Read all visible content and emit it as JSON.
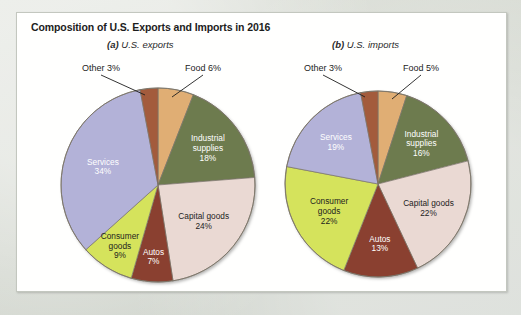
{
  "figure": {
    "title": "Composition of U.S. Exports and Imports in 2016",
    "panel_a_prefix": "(a)",
    "panel_a_caption": "U.S. exports",
    "panel_b_prefix": "(b)",
    "panel_b_caption": "U.S. imports"
  },
  "colors": {
    "food": "#e0ae74",
    "industrial_supplies": "#6d7b4e",
    "capital_goods": "#ead9d3",
    "autos": "#8a4030",
    "consumer_goods": "#d5e35c",
    "services": "#b3b2d8",
    "other": "#a35b3c",
    "slice_stroke": "#7a7468",
    "background": "#d8dcd5",
    "card": "#ffffff"
  },
  "chart_data": [
    {
      "type": "pie",
      "title": "(a) U.S. exports",
      "categories": [
        "Food",
        "Industrial supplies",
        "Capital goods",
        "Autos",
        "Consumer goods",
        "Services",
        "Other"
      ],
      "values": [
        6,
        18,
        24,
        7,
        9,
        34,
        3
      ],
      "labels": [
        "Food 6%",
        "Industrial supplies 18%",
        "Capital goods 24%",
        "Autos 7%",
        "Consumer goods 9%",
        "Services 34%",
        "Other 3%"
      ],
      "unit": "percent",
      "start_angle_deg": 0,
      "direction": "clockwise",
      "legend": "none",
      "slices": [
        {
          "name": "Food",
          "value": 6,
          "label_lines": [
            "Food 6%"
          ],
          "label_style": "callout",
          "text_color": "dark",
          "color": "#e0ae74"
        },
        {
          "name": "Industrial supplies",
          "value": 18,
          "label_lines": [
            "Industrial",
            "supplies",
            "18%"
          ],
          "label_style": "inside",
          "text_color": "light",
          "color": "#6d7b4e"
        },
        {
          "name": "Capital goods",
          "value": 24,
          "label_lines": [
            "Capital goods",
            "24%"
          ],
          "label_style": "inside",
          "text_color": "dark",
          "color": "#ead9d3"
        },
        {
          "name": "Autos",
          "value": 7,
          "label_lines": [
            "Autos",
            "7%"
          ],
          "label_style": "inside",
          "text_color": "light",
          "color": "#8a4030"
        },
        {
          "name": "Consumer goods",
          "value": 9,
          "label_lines": [
            "Consumer",
            "goods",
            "9%"
          ],
          "label_style": "inside",
          "text_color": "dark",
          "color": "#d5e35c"
        },
        {
          "name": "Services",
          "value": 34,
          "label_lines": [
            "Services",
            "34%"
          ],
          "label_style": "inside",
          "text_color": "light",
          "color": "#b3b2d8"
        },
        {
          "name": "Other",
          "value": 3,
          "label_lines": [
            "Other 3%"
          ],
          "label_style": "callout",
          "text_color": "dark",
          "color": "#a35b3c"
        }
      ]
    },
    {
      "type": "pie",
      "title": "(b) U.S. imports",
      "categories": [
        "Food",
        "Industrial supplies",
        "Capital goods",
        "Autos",
        "Consumer goods",
        "Services",
        "Other"
      ],
      "values": [
        5,
        16,
        22,
        13,
        22,
        19,
        3
      ],
      "labels": [
        "Food 5%",
        "Industrial supplies 16%",
        "Capital goods 22%",
        "Autos 13%",
        "Consumer goods 22%",
        "Services 19%",
        "Other 3%"
      ],
      "unit": "percent",
      "start_angle_deg": 0,
      "direction": "clockwise",
      "legend": "none",
      "slices": [
        {
          "name": "Food",
          "value": 5,
          "label_lines": [
            "Food 5%"
          ],
          "label_style": "callout",
          "text_color": "dark",
          "color": "#e0ae74"
        },
        {
          "name": "Industrial supplies",
          "value": 16,
          "label_lines": [
            "Industrial",
            "supplies",
            "16%"
          ],
          "label_style": "inside",
          "text_color": "light",
          "color": "#6d7b4e"
        },
        {
          "name": "Capital goods",
          "value": 22,
          "label_lines": [
            "Capital goods",
            "22%"
          ],
          "label_style": "inside",
          "text_color": "dark",
          "color": "#ead9d3"
        },
        {
          "name": "Autos",
          "value": 13,
          "label_lines": [
            "Autos",
            "13%"
          ],
          "label_style": "inside",
          "text_color": "light",
          "color": "#8a4030"
        },
        {
          "name": "Consumer goods",
          "value": 22,
          "label_lines": [
            "Consumer",
            "goods",
            "22%"
          ],
          "label_style": "inside",
          "text_color": "dark",
          "color": "#d5e35c"
        },
        {
          "name": "Services",
          "value": 19,
          "label_lines": [
            "Services",
            "19%"
          ],
          "label_style": "inside",
          "text_color": "light",
          "color": "#b3b2d8"
        },
        {
          "name": "Other",
          "value": 3,
          "label_lines": [
            "Other 3%"
          ],
          "label_style": "callout",
          "text_color": "dark",
          "color": "#a35b3c"
        }
      ]
    }
  ],
  "geometry": [
    {
      "cx": 141,
      "cy": 172,
      "r": 97,
      "callouts": {
        "Other": {
          "tx": 84,
          "ty": 58,
          "ax": 128,
          "ay": 82
        },
        "Food": {
          "tx": 186,
          "ty": 58,
          "ax": 155,
          "ay": 84
        }
      }
    },
    {
      "cx": 361,
      "cy": 171,
      "r": 93,
      "callouts": {
        "Other": {
          "tx": 306,
          "ty": 58,
          "ax": 348,
          "ay": 84
        },
        "Food": {
          "tx": 404,
          "ty": 58,
          "ax": 375,
          "ay": 86
        }
      }
    }
  ]
}
